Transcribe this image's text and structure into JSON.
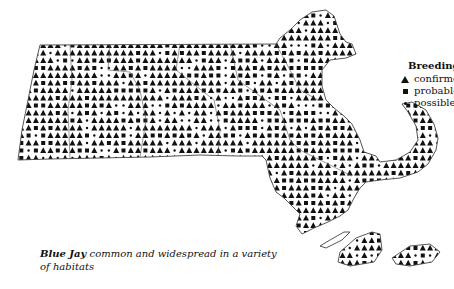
{
  "legend": {
    "title": "Breeding",
    "items": [
      {
        "symbol": "triangle",
        "label": "confirmed"
      },
      {
        "symbol": "square",
        "label": "probable"
      },
      {
        "symbol": "dot",
        "label": "possible"
      }
    ]
  },
  "caption": {
    "species": "Blue Jay",
    "text": " common and widespread in a variety of habitats"
  },
  "map": {
    "region": "Massachusetts",
    "grid": {
      "x0": 40,
      "y0": 48,
      "dx": 7.3,
      "dy": 7.5
    },
    "colors": {
      "ink": "#111111",
      "outline": "#444444",
      "background": "#ffffff"
    }
  }
}
